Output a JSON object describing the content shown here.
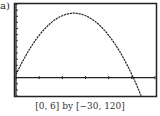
{
  "panel_label": "a)",
  "caption": "[0, 6] by [−30, 120]",
  "chart_data": {
    "type": "line",
    "title": "",
    "xlabel": "",
    "ylabel": "",
    "xlim": [
      0,
      6
    ],
    "ylim": [
      -30,
      120
    ],
    "x_ticks": [
      0,
      1,
      2,
      3,
      4,
      5,
      6
    ],
    "y_tick_spacing": 10,
    "grid": false,
    "series": [
      {
        "name": "parabola",
        "x": [
          0,
          0.5,
          1,
          1.5,
          2,
          2.5,
          3,
          3.5,
          4,
          4.5,
          5,
          5.5
        ],
        "y": [
          5,
          41,
          69,
          89,
          101,
          105,
          101,
          89,
          69,
          41,
          5,
          -39
        ]
      }
    ]
  }
}
